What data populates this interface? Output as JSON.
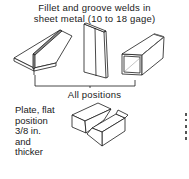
{
  "title": {
    "line1": "Fillet and groove welds in",
    "line2": "sheet metal (10 to 18 gage)"
  },
  "top_figures": [
    {
      "name": "fillet-weld-t-joint",
      "description": "T-joint fillet weld on sheet metal"
    },
    {
      "name": "butt-weld-sheet",
      "description": "Vertical butt/groove weld on sheet"
    },
    {
      "name": "square-tube-corner-weld",
      "description": "Square tube corner welds"
    }
  ],
  "bracket_caption": "All positions",
  "plate_section": {
    "label_lines": [
      "Plate, flat",
      "position",
      "3/8 in.",
      "and",
      "thicker"
    ],
    "figure": {
      "name": "plate-groove-weld",
      "description": "Two thick plate blocks with groove joint"
    }
  },
  "colors": {
    "ink": "#1a1a1a",
    "background": "#ffffff",
    "weld_bead": "#777777"
  }
}
